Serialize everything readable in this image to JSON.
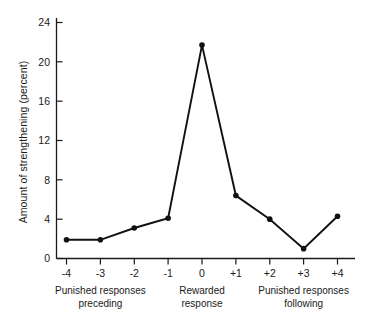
{
  "chart_data": {
    "type": "line",
    "title": "",
    "xlabel": "",
    "ylabel": "Amount of strengthening (percent)",
    "categories": [
      "-4",
      "-3",
      "-2",
      "-1",
      "0",
      "+1",
      "+2",
      "+3",
      "+4"
    ],
    "values": [
      1.9,
      1.9,
      3.1,
      4.1,
      21.7,
      6.4,
      4.0,
      1.0,
      4.3
    ],
    "series": [
      {
        "name": "Amount of strengthening",
        "values": [
          1.9,
          1.9,
          3.1,
          4.1,
          21.7,
          6.4,
          4.0,
          1.0,
          4.3
        ]
      }
    ],
    "xlim": [
      -4,
      4
    ],
    "ylim": [
      0,
      24
    ],
    "yticks": [
      "0",
      "4",
      "8",
      "12",
      "16",
      "20",
      "24"
    ],
    "ytick_values": [
      0,
      4,
      8,
      12,
      16,
      20,
      24
    ],
    "xticks": [
      "-4",
      "-3",
      "-2",
      "-1",
      "0",
      "+1",
      "+2",
      "+3",
      "+4"
    ],
    "grid": false,
    "legend": false,
    "marker": "filled-circle",
    "line_color": "#111111",
    "marker_color": "#111111",
    "axis_color": "#1a1a1a",
    "background": "#ffffff",
    "group_labels": [
      {
        "line1": "Punished responses",
        "line2": "preceding",
        "center_category": "-3"
      },
      {
        "line1": "Rewarded",
        "line2": "response",
        "center_category": "0"
      },
      {
        "line1": "Punished responses",
        "line2": "following",
        "center_category": "+3"
      }
    ],
    "annotations": []
  }
}
